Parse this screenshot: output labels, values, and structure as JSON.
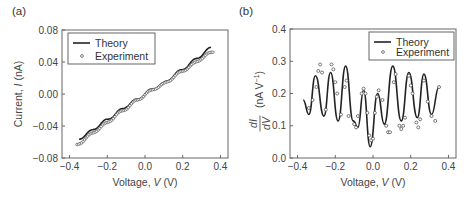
{
  "chart_data": [
    {
      "panel_label": "(a)",
      "type": "line",
      "title": "",
      "xlabel": "Voltage, V (V)",
      "ylabel": "Current, I (nA)",
      "xlim": [
        -0.44,
        0.44
      ],
      "ylim": [
        -0.08,
        0.08
      ],
      "xticks": [
        "-0.4",
        "-0.2",
        "0.0",
        "0.2",
        "0.4"
      ],
      "yticks": [
        "-0.08",
        "-0.04",
        "0.00",
        "0.04",
        "0.08"
      ],
      "grid": false,
      "legend": {
        "position": "upper left",
        "entries": [
          "Theory",
          "Experiment"
        ]
      },
      "series": [
        {
          "name": "Theory",
          "style": "line",
          "x": [
            -0.35,
            -0.3,
            -0.25,
            -0.2,
            -0.15,
            -0.1,
            -0.05,
            0.0,
            0.05,
            0.1,
            0.15,
            0.2,
            0.25,
            0.3,
            0.35
          ],
          "y": [
            -0.056,
            -0.049,
            -0.04,
            -0.032,
            -0.024,
            -0.015,
            -0.008,
            0.0,
            0.008,
            0.013,
            0.023,
            0.031,
            0.04,
            0.049,
            0.058
          ]
        },
        {
          "name": "Experiment",
          "style": "markers",
          "x": [
            -0.36,
            -0.3,
            -0.25,
            -0.2,
            -0.15,
            -0.1,
            -0.05,
            0.0,
            0.05,
            0.1,
            0.15,
            0.2,
            0.25,
            0.3,
            0.36
          ],
          "y": [
            -0.064,
            -0.053,
            -0.044,
            -0.036,
            -0.026,
            -0.018,
            -0.009,
            -0.001,
            0.007,
            0.012,
            0.021,
            0.029,
            0.036,
            0.045,
            0.053
          ]
        }
      ]
    },
    {
      "panel_label": "(b)",
      "type": "line",
      "title": "",
      "xlabel": "Voltage, V (V)",
      "ylabel": "dI/dV (nA V^-1)",
      "xlim": [
        -0.44,
        0.44
      ],
      "ylim": [
        0.0,
        0.4
      ],
      "xticks": [
        "-0.4",
        "-0.2",
        "0.0",
        "0.2",
        "0.4"
      ],
      "yticks": [
        "0.0",
        "0.1",
        "0.2",
        "0.3",
        "0.4"
      ],
      "grid": false,
      "legend": {
        "position": "upper right",
        "entries": [
          "Theory",
          "Experiment"
        ]
      },
      "series": [
        {
          "name": "Theory",
          "style": "line",
          "x": [
            -0.37,
            -0.34,
            -0.305,
            -0.26,
            -0.225,
            -0.185,
            -0.145,
            -0.105,
            -0.08,
            -0.05,
            -0.015,
            0.025,
            0.06,
            0.105,
            0.15,
            0.19,
            0.235,
            0.27,
            0.31,
            0.35
          ],
          "y": [
            0.18,
            0.135,
            0.255,
            0.13,
            0.265,
            0.115,
            0.285,
            0.115,
            0.095,
            0.21,
            0.035,
            0.2,
            0.105,
            0.285,
            0.115,
            0.265,
            0.125,
            0.26,
            0.135,
            0.22
          ]
        },
        {
          "name": "Experiment",
          "style": "markers",
          "x": [
            -0.34,
            -0.32,
            -0.3,
            -0.29,
            -0.28,
            -0.27,
            -0.25,
            -0.22,
            -0.21,
            -0.2,
            -0.19,
            -0.17,
            -0.15,
            -0.14,
            -0.13,
            -0.1,
            -0.09,
            -0.08,
            -0.06,
            -0.05,
            -0.04,
            -0.03,
            -0.02,
            -0.01,
            0.0,
            0.01,
            0.02,
            0.03,
            0.05,
            0.07,
            0.08,
            0.09,
            0.11,
            0.12,
            0.14,
            0.15,
            0.16,
            0.17,
            0.19,
            0.2,
            0.21,
            0.23,
            0.24,
            0.25,
            0.27,
            0.29,
            0.31,
            0.33,
            0.35
          ],
          "y": [
            0.155,
            0.18,
            0.22,
            0.27,
            0.29,
            0.265,
            0.15,
            0.29,
            0.275,
            0.235,
            0.2,
            0.135,
            0.22,
            0.24,
            0.13,
            0.105,
            0.095,
            0.13,
            0.2,
            0.215,
            0.2,
            0.14,
            0.07,
            0.055,
            0.06,
            0.14,
            0.19,
            0.21,
            0.18,
            0.1,
            0.08,
            0.08,
            0.235,
            0.26,
            0.1,
            0.09,
            0.1,
            0.125,
            0.255,
            0.225,
            0.2,
            0.11,
            0.095,
            0.12,
            0.24,
            0.175,
            0.13,
            0.115,
            0.22
          ]
        }
      ]
    }
  ]
}
